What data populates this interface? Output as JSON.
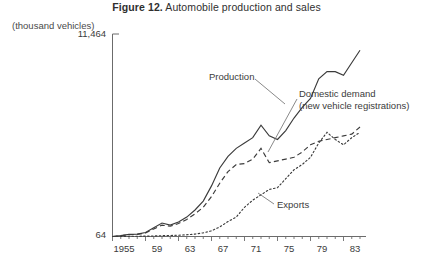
{
  "figure": {
    "number": "Figure 12.",
    "title": " Automobile production and sales",
    "unit_label": "(thousand vehicles)"
  },
  "annotations": {
    "production": "Production",
    "domestic_demand_line1": "Domestic demand",
    "domestic_demand_line2": "(new vehicle registrations)",
    "exports": "Exports"
  },
  "axes": {
    "y_top_label": "11,464",
    "y_bottom_label": "64",
    "x_labels": [
      "1955",
      "59",
      "63",
      "67",
      "71",
      "75",
      "79",
      "83"
    ]
  },
  "colors": {
    "line": "#3b3b3b",
    "text": "#3b3b3b",
    "background": "#ffffff"
  },
  "chart_data": {
    "type": "line",
    "title": "Figure 12. Automobile production and sales",
    "xlabel": "",
    "ylabel": "(thousand vehicles)",
    "ylim": [
      64,
      11464
    ],
    "xlim": [
      1955,
      1985
    ],
    "grid": false,
    "legend": "inline-annotations",
    "x": [
      1955,
      1956,
      1957,
      1958,
      1959,
      1960,
      1961,
      1962,
      1963,
      1964,
      1965,
      1966,
      1967,
      1968,
      1969,
      1970,
      1971,
      1972,
      1973,
      1974,
      1975,
      1976,
      1977,
      1978,
      1979,
      1980,
      1981,
      1982,
      1983,
      1984,
      1985
    ],
    "series": [
      {
        "name": "Production",
        "style": "solid",
        "values": [
          64,
          110,
          180,
          200,
          290,
          560,
          820,
          700,
          880,
          1150,
          1550,
          2050,
          2900,
          3900,
          4550,
          5000,
          5300,
          5600,
          6300,
          5700,
          5500,
          6000,
          6700,
          7300,
          7800,
          8900,
          9300,
          9300,
          9100,
          9800,
          10500
        ]
      },
      {
        "name": "Domestic demand (new vehicle registrations)",
        "style": "dashed",
        "values": [
          64,
          105,
          165,
          185,
          260,
          490,
          700,
          640,
          790,
          1020,
          1330,
          1700,
          2300,
          3050,
          3700,
          4100,
          4150,
          4400,
          5000,
          4200,
          4300,
          4400,
          4500,
          4800,
          5200,
          5400,
          5500,
          5600,
          5700,
          5800,
          6200
        ]
      },
      {
        "name": "Exports",
        "style": "dotted",
        "values": [
          64,
          70,
          75,
          78,
          85,
          95,
          110,
          120,
          135,
          160,
          200,
          270,
          380,
          600,
          900,
          1150,
          1700,
          2100,
          2400,
          2700,
          2800,
          3300,
          3800,
          4100,
          4500,
          5300,
          5900,
          5500,
          5200,
          5600,
          5900
        ]
      }
    ]
  }
}
